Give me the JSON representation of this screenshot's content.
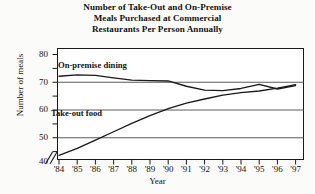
{
  "chart_data": {
    "type": "line",
    "title": "Number of Take-Out and On-Premise Meals Purchased at Commercial Restaurants Per Person Annually",
    "title_lines": [
      "Number of Take-Out and On-Premise",
      "Meals Purchased at Commercial",
      "Restaurants Per Person Annually"
    ],
    "xlabel": "Year",
    "ylabel": "Number of meals",
    "categories": [
      "'84",
      "'85",
      "'86",
      "'87",
      "'88",
      "'89",
      "'90",
      "'91",
      "'92",
      "'93",
      "'94",
      "'95",
      "'96",
      "'97"
    ],
    "x": [
      1984,
      1985,
      1986,
      1987,
      1988,
      1989,
      1990,
      1991,
      1992,
      1993,
      1994,
      1995,
      1996,
      1997
    ],
    "yticks": [
      40,
      50,
      60,
      70,
      80
    ],
    "ylim": [
      40,
      80
    ],
    "y_axis_break": true,
    "y_axis_break_symbol": "//",
    "grid": true,
    "grid_orientation": "horizontal",
    "legend_position": "inline-labels",
    "series": [
      {
        "name": "On-premise dining",
        "color": "#1a1a1a",
        "values": [
          70.0,
          70.5,
          70.3,
          69.4,
          68.6,
          68.4,
          68.3,
          66.4,
          65.0,
          64.8,
          65.6,
          67.1,
          65.4,
          66.6
        ]
      },
      {
        "name": "Take-out food",
        "color": "#1a1a1a",
        "values": [
          41.5,
          44.0,
          47.0,
          50.0,
          53.0,
          55.8,
          58.3,
          60.3,
          61.8,
          63.2,
          64.1,
          64.7,
          65.7,
          67.0
        ]
      }
    ]
  },
  "axis": {
    "y_tick_labels": [
      "80",
      "70",
      "60",
      "50",
      "40"
    ],
    "x_tick_labels": [
      "'84",
      "'85",
      "'86",
      "'87",
      "'88",
      "'89",
      "'90",
      "'91",
      "'92",
      "'93",
      "'94",
      "'95",
      "'96",
      "'97"
    ],
    "y_title": "Number of meals",
    "x_title": "Year"
  },
  "labels": {
    "on_premise": "On-premise dining",
    "take_out": "Take-out food"
  },
  "colors": {
    "background": "#fbfbfa",
    "plot_background": "#ffffff",
    "line": "#1a1a1a",
    "grid": "#4a4a4a",
    "border": "#1a1a1a",
    "text": "#131313"
  }
}
